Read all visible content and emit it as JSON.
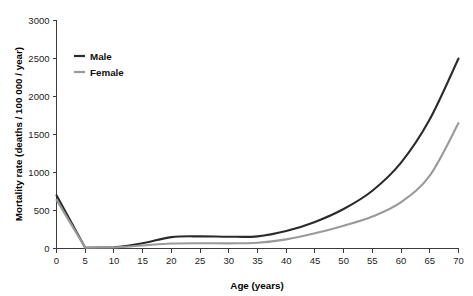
{
  "chart_data": {
    "type": "line",
    "title": "",
    "xlabel": "Age (years)",
    "ylabel": "Mortality rate (deaths / 100 000 / year)",
    "xlim": [
      0,
      70
    ],
    "ylim": [
      0,
      3000
    ],
    "grid": false,
    "legend_position": "top-left inside plot",
    "x": [
      0,
      5,
      10,
      15,
      20,
      25,
      30,
      35,
      40,
      45,
      50,
      55,
      60,
      65,
      70
    ],
    "xticks": [
      "0",
      "5",
      "10",
      "15",
      "20",
      "25",
      "30",
      "35",
      "40",
      "45",
      "50",
      "55",
      "60",
      "65",
      "70"
    ],
    "yticks": [
      "0",
      "500",
      "1000",
      "1500",
      "2000",
      "2500",
      "3000"
    ],
    "series": [
      {
        "name": "Male",
        "color": "#2b2b2b",
        "values": [
          700,
          10,
          15,
          70,
          150,
          160,
          155,
          160,
          230,
          350,
          520,
          760,
          1130,
          1700,
          2500
        ]
      },
      {
        "name": "Female",
        "color": "#9a9a9a",
        "values": [
          640,
          12,
          14,
          40,
          65,
          70,
          68,
          75,
          120,
          200,
          300,
          420,
          610,
          960,
          1650
        ]
      }
    ]
  },
  "legend": {
    "entries": [
      {
        "label": "Male",
        "color": "#2b2b2b"
      },
      {
        "label": "Female",
        "color": "#9a9a9a"
      }
    ]
  },
  "axes": {
    "x_title": "Age (years)",
    "y_title": "Mortality rate (deaths / 100 000 / year)"
  }
}
